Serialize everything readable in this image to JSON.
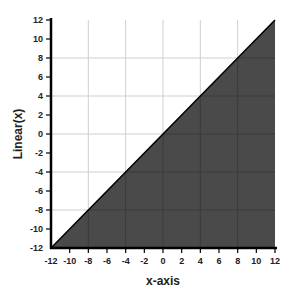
{
  "chart_data": {
    "type": "area",
    "title": "",
    "xlabel": "x-axis",
    "ylabel": "Linear(x)",
    "xlim": [
      -12,
      12
    ],
    "ylim": [
      -12,
      12
    ],
    "x_ticks": [
      -12,
      -10,
      -8,
      -6,
      -4,
      -2,
      0,
      2,
      4,
      6,
      8,
      10,
      12
    ],
    "y_ticks": [
      -12,
      -10,
      -8,
      -6,
      -4,
      -2,
      0,
      2,
      4,
      6,
      8,
      10,
      12
    ],
    "grid": true,
    "grid_step": 4,
    "legend": null,
    "series": [
      {
        "name": "Linear(x)",
        "x": [
          -12,
          12
        ],
        "y": [
          -12,
          12
        ],
        "fill": "below",
        "fill_color": "#4a4a4a",
        "line_color": "#000000"
      }
    ]
  }
}
